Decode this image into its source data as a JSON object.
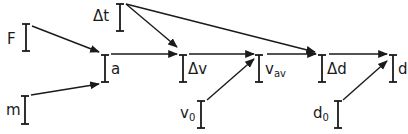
{
  "diagram": {
    "colors": {
      "stroke": "#1a1a1a",
      "background": "#ffffff"
    },
    "nodes": [
      {
        "id": "dt",
        "label": "Δt",
        "sub": "",
        "x": 120,
        "y1": 4,
        "y2": 31,
        "lx": 93,
        "ly": 9
      },
      {
        "id": "F",
        "label": "F",
        "sub": "",
        "x": 26,
        "y1": 24,
        "y2": 51,
        "lx": 7,
        "ly": 32
      },
      {
        "id": "a",
        "label": "a",
        "sub": "",
        "x": 105,
        "y1": 55,
        "y2": 82,
        "lx": 111,
        "ly": 62
      },
      {
        "id": "m",
        "label": "m",
        "sub": "",
        "x": 25,
        "y1": 96,
        "y2": 124,
        "lx": 6,
        "ly": 103
      },
      {
        "id": "dv",
        "label": "Δv",
        "sub": "",
        "x": 183,
        "y1": 55,
        "y2": 82,
        "lx": 188,
        "ly": 62
      },
      {
        "id": "v0",
        "label": "v",
        "sub": "0",
        "x": 201,
        "y1": 101,
        "y2": 128,
        "lx": 180,
        "ly": 106
      },
      {
        "id": "vav",
        "label": "v",
        "sub": "av",
        "x": 259,
        "y1": 55,
        "y2": 82,
        "lx": 265,
        "ly": 62
      },
      {
        "id": "dd",
        "label": "Δd",
        "sub": "",
        "x": 322,
        "y1": 55,
        "y2": 82,
        "lx": 327,
        "ly": 62
      },
      {
        "id": "d0",
        "label": "d",
        "sub": "0",
        "x": 338,
        "y1": 101,
        "y2": 128,
        "lx": 313,
        "ly": 106
      },
      {
        "id": "d",
        "label": "d",
        "sub": "",
        "x": 393,
        "y1": 55,
        "y2": 82,
        "lx": 398,
        "ly": 62
      }
    ],
    "edges": [
      {
        "from": "F",
        "to": "a",
        "x1": 32,
        "y1": 26,
        "x2": 99,
        "y2": 52
      },
      {
        "from": "m",
        "to": "a",
        "x1": 31,
        "y1": 95,
        "x2": 99,
        "y2": 84
      },
      {
        "from": "a",
        "to": "dv",
        "x1": 111,
        "y1": 54,
        "x2": 177,
        "y2": 54
      },
      {
        "from": "dt",
        "to": "dv",
        "x1": 126,
        "y1": 4,
        "x2": 177,
        "y2": 47
      },
      {
        "from": "dv",
        "to": "vav",
        "x1": 189,
        "y1": 54,
        "x2": 254,
        "y2": 54
      },
      {
        "from": "v0",
        "to": "vav",
        "x1": 207,
        "y1": 100,
        "x2": 254,
        "y2": 59
      },
      {
        "from": "dt",
        "to": "dd",
        "x1": 126,
        "y1": 4,
        "x2": 315,
        "y2": 52
      },
      {
        "from": "vav",
        "to": "dd",
        "x1": 267,
        "y1": 54,
        "x2": 316,
        "y2": 54
      },
      {
        "from": "dd",
        "to": "d",
        "x1": 329,
        "y1": 54,
        "x2": 387,
        "y2": 54
      },
      {
        "from": "d0",
        "to": "d",
        "x1": 343,
        "y1": 100,
        "x2": 387,
        "y2": 61
      }
    ]
  }
}
